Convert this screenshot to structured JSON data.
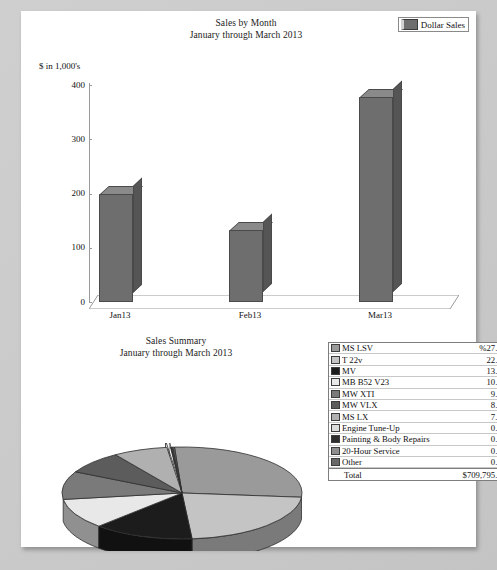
{
  "bar_section": {
    "title_line1": "Sales by Month",
    "title_line2": "January through March 2013",
    "legend_label": "Dollar Sales",
    "axis_unit": "$ in 1,000's"
  },
  "pie_section": {
    "title_line1": "Sales Summary",
    "title_line2": "January through March 2013",
    "total_label": "Total",
    "total_value": "$709,795.00"
  },
  "chart_data": [
    {
      "type": "bar",
      "title": "Sales by Month",
      "subtitle": "January through March 2013",
      "xlabel": "",
      "ylabel": "$ in 1,000's",
      "categories": [
        "Jan13",
        "Feb13",
        "Mar13"
      ],
      "values": [
        200,
        133,
        377
      ],
      "series": [
        {
          "name": "Dollar Sales",
          "values": [
            200,
            133,
            377
          ],
          "color": "#6e6e6e"
        }
      ],
      "yticks": [
        0,
        100,
        200,
        300,
        400
      ],
      "ylim": [
        0,
        400
      ],
      "grid": false,
      "legend_position": "top-right",
      "three_d": true
    },
    {
      "type": "pie",
      "title": "Sales Summary",
      "subtitle": "January through March 2013",
      "value_suffix": "%",
      "three_d": true,
      "legend_position": "right",
      "total_label": "Total",
      "total_value": "$709,795.00",
      "labels": [
        "MS LSV",
        "T 22v",
        "MV",
        "MB B52 V23",
        "MW XTI",
        "MW VLX",
        "MS LX",
        "Engine Tune-Up",
        "Painting & Body Repairs",
        "20-Hour Service",
        "Other"
      ],
      "values": [
        27.47,
        22.19,
        13.53,
        10.57,
        9.86,
        8.03,
        7.33,
        0.49,
        0.19,
        0.12,
        0.22
      ],
      "display_values": [
        "%27.47",
        "22.19",
        "13.53",
        "10.57",
        "9.86",
        "8.03",
        "7.33",
        "0.49",
        "0.19",
        "0.12",
        "0.22"
      ],
      "colors": [
        "#9a9a9a",
        "#c4c4c4",
        "#1c1c1c",
        "#e8e8e8",
        "#7a7a7a",
        "#5c5c5c",
        "#b0b0b0",
        "#dcdcdc",
        "#2e2e2e",
        "#8e8e8e",
        "#686868"
      ]
    }
  ]
}
